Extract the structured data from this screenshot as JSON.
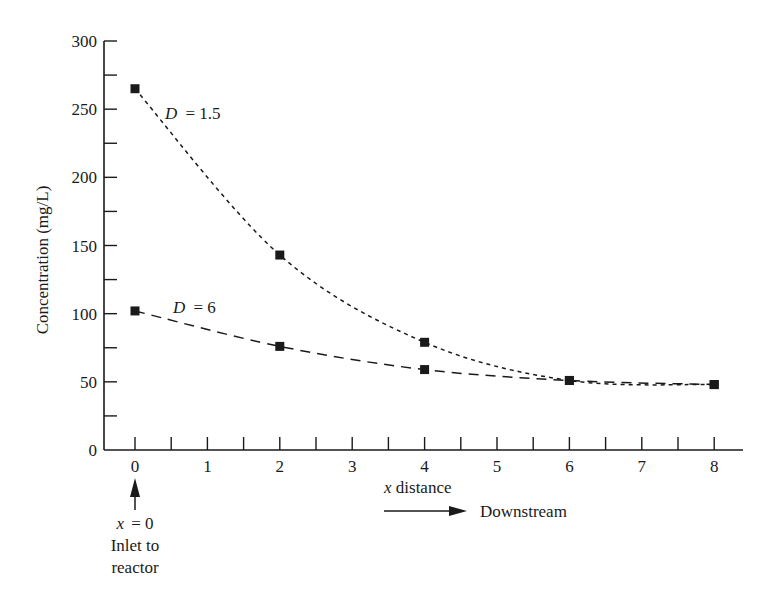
{
  "chart_data": {
    "type": "line",
    "title": "",
    "xlabel": "x distance",
    "ylabel": "Concentration (mg/L)",
    "xlim": [
      0,
      8
    ],
    "ylim": [
      0,
      300
    ],
    "x_ticks": [
      0,
      1,
      2,
      3,
      4,
      5,
      6,
      7,
      8
    ],
    "x_minor_step": 0.5,
    "y_ticks": [
      0,
      50,
      100,
      150,
      200,
      250,
      300
    ],
    "y_minor_step": 25,
    "grid": false,
    "series": [
      {
        "name": "D = 1.5",
        "label_var": "D",
        "label_value": "= 1.5",
        "line_style": "dotted-dash",
        "marker": "square",
        "x": [
          0,
          2,
          4,
          6,
          8
        ],
        "y": [
          265,
          143,
          79,
          51,
          48
        ]
      },
      {
        "name": "D = 6",
        "label_var": "D",
        "label_value": "= 6",
        "line_style": "long-dash",
        "marker": "square",
        "x": [
          0,
          2,
          4,
          6,
          8
        ],
        "y": [
          102,
          76,
          59,
          51,
          48
        ]
      }
    ],
    "annotations": {
      "inlet_var": "x",
      "inlet_eq": "= 0",
      "inlet_line1": "Inlet to",
      "inlet_line2": "reactor",
      "xlabel_var": "x",
      "xlabel_rest": " distance",
      "downstream": "Downstream"
    }
  }
}
